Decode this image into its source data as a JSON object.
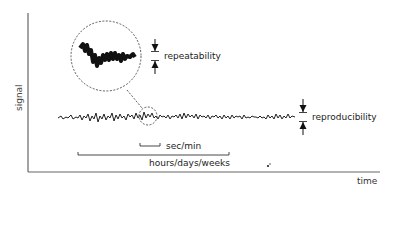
{
  "diagram": {
    "axes": {
      "y_label": "signal",
      "x_label": "time"
    },
    "annotations": {
      "repeatability": "repeatability",
      "reproducibility": "reproducibility",
      "short_timescale": "sec/min",
      "long_timescale": "hours/days/weeks"
    },
    "elements": {
      "zoom_circle": "magnified view of short-term signal noise",
      "signal_trace": "noisy signal over time"
    },
    "colors": {
      "ink": "#1a1a1a",
      "axis": "#555555",
      "background": "#ffffff"
    }
  }
}
